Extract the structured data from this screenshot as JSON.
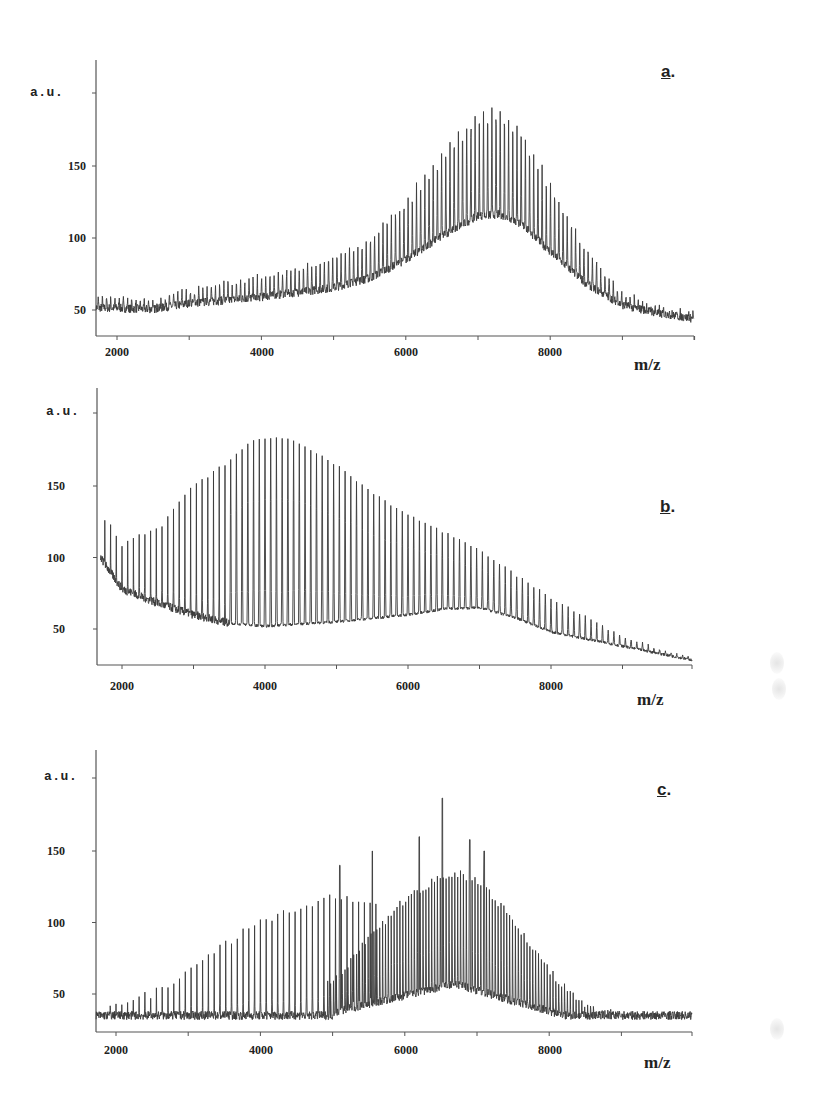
{
  "figure": {
    "x_axis_title": "m/z",
    "y_axis_unit": "a.u.",
    "line_color": "#3a3a3a",
    "axis_color": "#555555"
  },
  "chart_data": [
    {
      "type": "line",
      "panel_label": "a",
      "title": "a.",
      "xlabel": "m/z",
      "ylabel": "a.u.",
      "xlim": [
        1700,
        10000
      ],
      "ylim": [
        30,
        215
      ],
      "x_ticks": [
        2000,
        4000,
        6000,
        8000
      ],
      "y_ticks": [
        50,
        100,
        150
      ],
      "grid": false,
      "description": "Broad envelope of densely spaced oligomer peaks; baseline ~55 at 2000, rising to a maximum near 7000-7300 m/z (~190), then decaying to ~43 at 10000.",
      "envelope_points": {
        "x": [
          1700,
          2500,
          3000,
          4000,
          5000,
          5500,
          6000,
          6500,
          7000,
          7300,
          7600,
          8000,
          8500,
          9000,
          9500,
          10000
        ],
        "y": [
          55,
          53,
          60,
          68,
          80,
          92,
          115,
          145,
          170,
          172,
          160,
          125,
          85,
          58,
          48,
          43
        ]
      },
      "peak_spacing_mz": 58
    },
    {
      "type": "line",
      "panel_label": "b",
      "title": "b.",
      "xlabel": "m/z",
      "ylabel": "a.u.",
      "xlim": [
        1700,
        10000
      ],
      "ylim": [
        22,
        212
      ],
      "x_ticks": [
        2000,
        4000,
        6000,
        8000
      ],
      "y_ticks": [
        50,
        100,
        150
      ],
      "grid": false,
      "description": "Well-resolved periodic peaks (~80 m/z spacing). Peak heights rise from ~110 near 2000 to a maximum ~185 at 3800-4300 m/z, then decline to ~30 at 10000. Baseline starts ~100 at 1700, drops to ~52 by 3500, slight hump ~65 near 6500-7000.",
      "peak_tops": {
        "x": [
          1750,
          2000,
          2500,
          3000,
          3500,
          3800,
          4200,
          4500,
          5000,
          5500,
          6000,
          6500,
          7000,
          7500,
          8000,
          8500,
          9000,
          9500,
          10000
        ],
        "y": [
          128,
          110,
          120,
          150,
          168,
          182,
          184,
          180,
          165,
          145,
          130,
          118,
          105,
          88,
          72,
          58,
          45,
          36,
          30
        ]
      },
      "baseline": {
        "x": [
          1700,
          2000,
          2500,
          3000,
          3500,
          4000,
          5000,
          6000,
          6500,
          7000,
          7500,
          8000,
          9000,
          10000
        ],
        "y": [
          100,
          78,
          68,
          60,
          54,
          52,
          55,
          60,
          64,
          65,
          58,
          48,
          38,
          28
        ]
      },
      "peak_spacing_mz": 80
    },
    {
      "type": "line",
      "panel_label": "c",
      "title": "c.",
      "xlabel": "m/z",
      "ylabel": "a.u.",
      "xlim": [
        1700,
        10000
      ],
      "ylim": [
        22,
        212
      ],
      "x_ticks": [
        2000,
        4000,
        6000,
        8000
      ],
      "y_ticks": [
        50,
        100,
        150
      ],
      "grid": false,
      "description": "Two overlapping peak distributions. First series rises from ~42 near 2000 to ~110-120 at 4500-5000 m/z; second, denser distribution centered ~6700 m/z reaching ~145, with isolated taller spikes at ~5500 (~150), ~6200 (~160), ~6500 (~187), ~6900 (~158), ~7100 (~150). Falls to baseline ~32 beyond 8200.",
      "series": [
        {
          "name": "low-mass series",
          "x": [
            2000,
            2500,
            3000,
            3500,
            4000,
            4500,
            5000,
            5500
          ],
          "y": [
            42,
            50,
            65,
            85,
            100,
            110,
            118,
            115
          ]
        },
        {
          "name": "high-mass series",
          "x": [
            5000,
            5500,
            6000,
            6500,
            6700,
            7000,
            7500,
            8000,
            8500,
            9000,
            10000
          ],
          "y": [
            60,
            95,
            125,
            142,
            145,
            140,
            110,
            70,
            42,
            35,
            32
          ]
        }
      ],
      "spikes": {
        "x": [
          5100,
          5550,
          6200,
          6520,
          6900,
          7100
        ],
        "y": [
          140,
          150,
          160,
          187,
          158,
          150
        ]
      },
      "baseline_level": 35,
      "peak_spacing_mz": 80
    }
  ],
  "panels": [
    {
      "letter": "a",
      "dot": ".",
      "au": "a.u.",
      "yticks": [
        "150",
        "100",
        "50"
      ],
      "xticks": [
        "2000",
        "4000",
        "6000",
        "8000"
      ],
      "xtitle": "m/z"
    },
    {
      "letter": "b",
      "dot": ".",
      "au": "a.u.",
      "yticks": [
        "150",
        "100",
        "50"
      ],
      "xticks": [
        "2000",
        "4000",
        "6000",
        "8000"
      ],
      "xtitle": "m/z"
    },
    {
      "letter": "c",
      "dot": ".",
      "au": "a.u.",
      "yticks": [
        "150",
        "100",
        "50"
      ],
      "xticks": [
        "2000",
        "4000",
        "6000",
        "8000"
      ],
      "xtitle": "m/z"
    }
  ]
}
